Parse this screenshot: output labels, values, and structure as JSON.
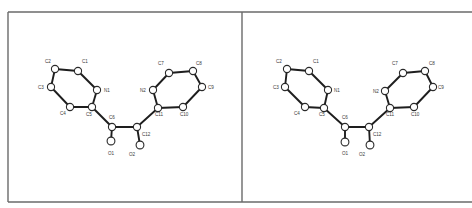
{
  "figure": {
    "view_type": "stereo-pair",
    "frame": {
      "left": 8,
      "top": 12,
      "bottom": 202,
      "right": 472,
      "divider_x": 242,
      "color": "#6a6a6a"
    },
    "colors": {
      "background": "#ffffff",
      "bond": "#1e1e1e",
      "atom_fill": "#ffffff",
      "atom_stroke": "#2a2a2a",
      "label": "#3a3a3a"
    }
  },
  "panels": [
    {
      "name": "left-view",
      "atoms": [
        {
          "id": "C1",
          "label": "C1",
          "x": 78,
          "y": 71,
          "r": 3.6,
          "lx": 82,
          "ly": 63,
          "anchor": "start"
        },
        {
          "id": "C2",
          "label": "C2",
          "x": 55,
          "y": 69,
          "r": 3.6,
          "lx": 45,
          "ly": 63,
          "anchor": "start"
        },
        {
          "id": "C3",
          "label": "C3",
          "x": 51,
          "y": 87,
          "r": 3.6,
          "lx": 38,
          "ly": 89,
          "anchor": "start"
        },
        {
          "id": "N1",
          "label": "N1",
          "x": 97,
          "y": 90,
          "r": 3.6,
          "lx": 104,
          "ly": 92,
          "anchor": "start"
        },
        {
          "id": "C4",
          "label": "C4",
          "x": 70,
          "y": 107,
          "r": 3.6,
          "lx": 60,
          "ly": 115,
          "anchor": "start"
        },
        {
          "id": "C5",
          "label": "C5",
          "x": 92,
          "y": 107,
          "r": 3.6,
          "lx": 86,
          "ly": 116,
          "anchor": "start"
        },
        {
          "id": "C6",
          "label": "C6",
          "x": 112,
          "y": 127,
          "r": 3.6,
          "lx": 109,
          "ly": 119,
          "anchor": "start"
        },
        {
          "id": "C12",
          "label": "C12",
          "x": 137,
          "y": 127,
          "r": 3.6,
          "lx": 142,
          "ly": 136,
          "anchor": "start"
        },
        {
          "id": "O1",
          "label": "O1",
          "x": 111,
          "y": 141,
          "r": 3.9,
          "lx": 108,
          "ly": 155,
          "anchor": "start"
        },
        {
          "id": "O2",
          "label": "O2",
          "x": 140,
          "y": 145,
          "r": 3.9,
          "lx": 129,
          "ly": 156,
          "anchor": "start"
        },
        {
          "id": "N2",
          "label": "N2",
          "x": 153,
          "y": 90,
          "r": 3.6,
          "lx": 140,
          "ly": 92,
          "anchor": "start"
        },
        {
          "id": "C7",
          "label": "C7",
          "x": 169,
          "y": 73,
          "r": 3.6,
          "lx": 158,
          "ly": 65,
          "anchor": "start"
        },
        {
          "id": "C8",
          "label": "C8",
          "x": 193,
          "y": 71,
          "r": 3.6,
          "lx": 196,
          "ly": 65,
          "anchor": "start"
        },
        {
          "id": "C9",
          "label": "C9",
          "x": 202,
          "y": 87,
          "r": 3.6,
          "lx": 208,
          "ly": 89,
          "anchor": "start"
        },
        {
          "id": "C10",
          "label": "C10",
          "x": 183,
          "y": 107,
          "r": 3.6,
          "lx": 180,
          "ly": 116,
          "anchor": "start"
        },
        {
          "id": "C11",
          "label": "C11",
          "x": 158,
          "y": 108,
          "r": 3.6,
          "lx": 155,
          "ly": 116,
          "anchor": "start"
        }
      ]
    },
    {
      "name": "right-view",
      "atoms": [
        {
          "id": "C1",
          "label": "C1",
          "x": 309,
          "y": 71,
          "r": 3.6,
          "lx": 313,
          "ly": 63,
          "anchor": "start"
        },
        {
          "id": "C2",
          "label": "C2",
          "x": 287,
          "y": 69,
          "r": 3.6,
          "lx": 276,
          "ly": 63,
          "anchor": "start"
        },
        {
          "id": "C3",
          "label": "C3",
          "x": 285,
          "y": 87,
          "r": 3.6,
          "lx": 273,
          "ly": 89,
          "anchor": "start"
        },
        {
          "id": "N1",
          "label": "N1",
          "x": 328,
          "y": 90,
          "r": 3.6,
          "lx": 334,
          "ly": 92,
          "anchor": "start"
        },
        {
          "id": "C4",
          "label": "C4",
          "x": 305,
          "y": 107,
          "r": 3.6,
          "lx": 294,
          "ly": 115,
          "anchor": "start"
        },
        {
          "id": "C5",
          "label": "C5",
          "x": 324,
          "y": 108,
          "r": 3.6,
          "lx": 319,
          "ly": 116,
          "anchor": "start"
        },
        {
          "id": "C6",
          "label": "C6",
          "x": 345,
          "y": 127,
          "r": 3.6,
          "lx": 342,
          "ly": 119,
          "anchor": "start"
        },
        {
          "id": "C12",
          "label": "C12",
          "x": 369,
          "y": 127,
          "r": 3.6,
          "lx": 373,
          "ly": 136,
          "anchor": "start"
        },
        {
          "id": "O1",
          "label": "O1",
          "x": 345,
          "y": 142,
          "r": 3.9,
          "lx": 342,
          "ly": 155,
          "anchor": "start"
        },
        {
          "id": "O2",
          "label": "O2",
          "x": 370,
          "y": 145,
          "r": 3.9,
          "lx": 359,
          "ly": 156,
          "anchor": "start"
        },
        {
          "id": "N2",
          "label": "N2",
          "x": 385,
          "y": 91,
          "r": 3.6,
          "lx": 373,
          "ly": 93,
          "anchor": "start"
        },
        {
          "id": "C7",
          "label": "C7",
          "x": 403,
          "y": 73,
          "r": 3.6,
          "lx": 392,
          "ly": 65,
          "anchor": "start"
        },
        {
          "id": "C8",
          "label": "C8",
          "x": 425,
          "y": 71,
          "r": 3.6,
          "lx": 429,
          "ly": 65,
          "anchor": "start"
        },
        {
          "id": "C9",
          "label": "C9",
          "x": 433,
          "y": 87,
          "r": 3.6,
          "lx": 438,
          "ly": 89,
          "anchor": "start"
        },
        {
          "id": "C10",
          "label": "C10",
          "x": 414,
          "y": 107,
          "r": 3.6,
          "lx": 411,
          "ly": 116,
          "anchor": "start"
        },
        {
          "id": "C11",
          "label": "C11",
          "x": 390,
          "y": 108,
          "r": 3.6,
          "lx": 386,
          "ly": 116,
          "anchor": "start"
        }
      ]
    }
  ],
  "bonds": [
    [
      "C1",
      "C2"
    ],
    [
      "C2",
      "C3"
    ],
    [
      "C3",
      "C4"
    ],
    [
      "C4",
      "C5"
    ],
    [
      "C5",
      "N1"
    ],
    [
      "N1",
      "C1"
    ],
    [
      "C5",
      "C6"
    ],
    [
      "C6",
      "C12"
    ],
    [
      "C6",
      "O1"
    ],
    [
      "C12",
      "O2"
    ],
    [
      "C12",
      "C11"
    ],
    [
      "C11",
      "N2"
    ],
    [
      "N2",
      "C7"
    ],
    [
      "C7",
      "C8"
    ],
    [
      "C8",
      "C9"
    ],
    [
      "C9",
      "C10"
    ],
    [
      "C10",
      "C11"
    ]
  ]
}
